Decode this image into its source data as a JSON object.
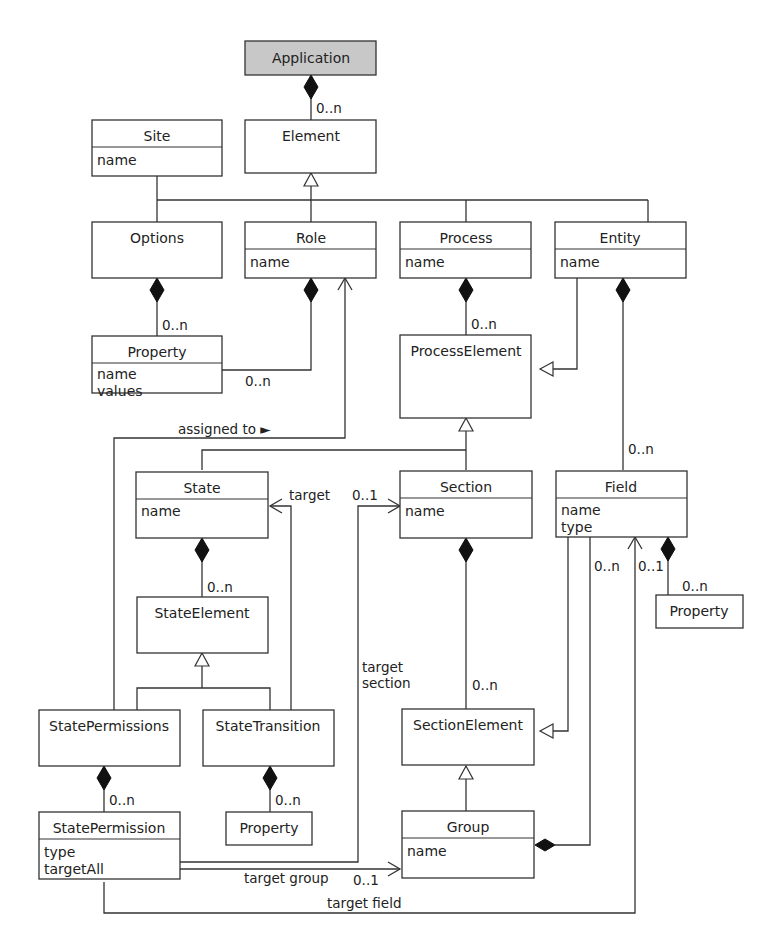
{
  "diagram": {
    "type": "UML class diagram",
    "classes": {
      "application": {
        "name": "Application",
        "attributes": []
      },
      "element": {
        "name": "Element",
        "attributes": []
      },
      "site": {
        "name": "Site",
        "attributes": [
          "name"
        ]
      },
      "options": {
        "name": "Options",
        "attributes": []
      },
      "role": {
        "name": "Role",
        "attributes": [
          "name"
        ]
      },
      "process": {
        "name": "Process",
        "attributes": [
          "name"
        ]
      },
      "entity": {
        "name": "Entity",
        "attributes": [
          "name"
        ]
      },
      "options_property": {
        "name": "Property",
        "attributes": [
          "name",
          "values"
        ]
      },
      "process_element": {
        "name": "ProcessElement",
        "attributes": []
      },
      "state": {
        "name": "State",
        "attributes": [
          "name"
        ]
      },
      "section": {
        "name": "Section",
        "attributes": [
          "name"
        ]
      },
      "field": {
        "name": "Field",
        "attributes": [
          "name",
          "type"
        ]
      },
      "field_property": {
        "name": "Property",
        "attributes": []
      },
      "state_element": {
        "name": "StateElement",
        "attributes": []
      },
      "state_permissions": {
        "name": "StatePermissions",
        "attributes": []
      },
      "state_transition": {
        "name": "StateTransition",
        "attributes": []
      },
      "section_element": {
        "name": "SectionElement",
        "attributes": []
      },
      "state_permission": {
        "name": "StatePermission",
        "attributes": [
          "type",
          "targetAll"
        ]
      },
      "transition_property": {
        "name": "Property",
        "attributes": []
      },
      "group": {
        "name": "Group",
        "attributes": [
          "name"
        ]
      }
    },
    "labels": {
      "app_element_mult": "0..n",
      "options_property_mult": "0..n",
      "role_property_mult": "0..n",
      "process_pe_mult": "0..n",
      "entity_field_mult": "0..n",
      "assigned_to": "assigned to ►",
      "target": "target",
      "target_section_mult": "0..1",
      "state_se_mult": "0..n",
      "field_group_mult": "0..n",
      "field_target_mult": "0..1",
      "field_property_mult": "0..n",
      "target_section_line1": "target",
      "target_section_line2": "section",
      "section_se_mult": "0..n",
      "sp_permission_mult": "0..n",
      "st_property_mult": "0..n",
      "target_group": "target group",
      "target_group_mult": "0..1",
      "target_field": "target field"
    },
    "colors": {
      "root_fill": "#c8c8c8",
      "line": "#333333",
      "background": "#ffffff"
    }
  }
}
